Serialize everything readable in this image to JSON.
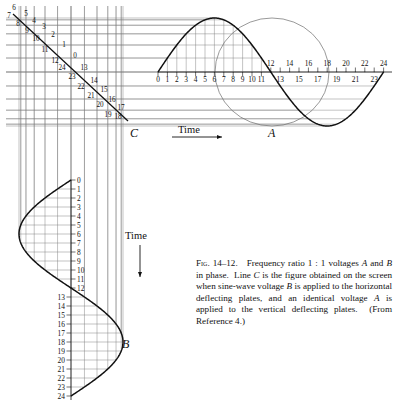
{
  "figure": {
    "caption_number": "Fig. 14–12.",
    "caption_text": "Frequency ratio 1 : 1 voltages A and B in phase. Line C is the figure obtained on the screen when sine-wave voltage B is applied to the horizontal deflecting plates, and an identical voltage A is applied to the vertical deflecting plates. (From Reference 4.)",
    "caption_parts": [
      "Frequency ratio 1 : 1 voltages",
      "A",
      " and ",
      "B",
      " in phase.  Line ",
      "C",
      " is the figure obtained on the screen when sine-wave voltage ",
      "B",
      " is applied to the horizontal deflecting plates, and an identical voltage ",
      "A",
      " is applied to the vertical deflecting plates.  (From Reference 4.)"
    ]
  },
  "labels": {
    "wave_a": "A",
    "wave_b": "B",
    "line_c": "C",
    "time_horizontal": "Time",
    "time_vertical": "Time"
  },
  "chart_data": {
    "type": "line",
    "title": "Frequency ratio 1 : 1 voltages A and B in phase",
    "xlabel": "Time",
    "ylabel": "Time",
    "grid": false,
    "legend": "none",
    "series": [
      {
        "name": "A",
        "orientation": "horizontal",
        "description": "sine-wave voltage applied to vertical deflecting plates, plotted against horizontal time axis",
        "x": [
          0,
          1,
          2,
          3,
          4,
          5,
          6,
          7,
          8,
          9,
          10,
          11,
          12,
          13,
          14,
          15,
          16,
          17,
          18,
          19,
          20,
          21,
          22,
          23,
          24
        ],
        "values": [
          0.0,
          0.259,
          0.5,
          0.707,
          0.866,
          0.966,
          1.0,
          0.966,
          0.866,
          0.707,
          0.5,
          0.259,
          0.0,
          -0.259,
          -0.5,
          -0.707,
          -0.866,
          -0.966,
          -1.0,
          -0.966,
          -0.866,
          -0.707,
          -0.5,
          -0.259,
          0.0
        ],
        "xlim": [
          0,
          24
        ],
        "ylim": [
          -1,
          1
        ],
        "tick_labels_above": [
          "12",
          "14",
          "16",
          "18",
          "20",
          "22",
          "24"
        ],
        "tick_labels_below": [
          "13",
          "15",
          "17",
          "19",
          "21",
          "23"
        ],
        "tick_labels_baseline": [
          "0",
          "1",
          "2",
          "3",
          "4",
          "5",
          "6",
          "7",
          "8",
          "9",
          "10",
          "11"
        ]
      },
      {
        "name": "B",
        "orientation": "vertical",
        "description": "sine-wave voltage applied to horizontal deflecting plates, plotted against vertical (downward) time axis",
        "t": [
          0,
          1,
          2,
          3,
          4,
          5,
          6,
          7,
          8,
          9,
          10,
          11,
          12,
          13,
          14,
          15,
          16,
          17,
          18,
          19,
          20,
          21,
          22,
          23,
          24
        ],
        "values": [
          0.0,
          -0.259,
          -0.5,
          -0.707,
          -0.866,
          -0.966,
          -1.0,
          -0.966,
          -0.866,
          -0.707,
          -0.5,
          -0.259,
          0.0,
          0.259,
          0.5,
          0.707,
          0.866,
          0.966,
          1.0,
          0.966,
          0.866,
          0.707,
          0.5,
          0.259,
          0.0
        ],
        "tlim": [
          0,
          24
        ],
        "ylim": [
          -1,
          1
        ],
        "tick_labels_right": [
          "0",
          "1",
          "2",
          "3",
          "4",
          "5",
          "6",
          "7",
          "8",
          "9",
          "10",
          "11",
          "12"
        ],
        "tick_labels_left": [
          "13",
          "14",
          "15",
          "16",
          "17",
          "18",
          "19",
          "20",
          "21",
          "22",
          "23",
          "24"
        ]
      },
      {
        "name": "C",
        "orientation": "lissajous",
        "description": "resulting Lissajous figure: straight diagonal line for 1:1 ratio, in phase",
        "phase_ratio": "1 : 1",
        "phase_difference_deg": 0,
        "point_labels": [
          "6",
          "7",
          "5",
          "8",
          "4",
          "3",
          "9",
          "2",
          "10",
          "1",
          "11",
          "0",
          "12",
          "24",
          "13",
          "23",
          "14",
          "22",
          "15",
          "21",
          "16",
          "20",
          "17",
          "19",
          "18"
        ]
      }
    ],
    "annotations": [
      {
        "text": "A",
        "role": "horizontal-sine-label"
      },
      {
        "text": "B",
        "role": "vertical-sine-label"
      },
      {
        "text": "C",
        "role": "lissajous-line-label"
      },
      {
        "text": "Time",
        "role": "horizontal-axis-arrow"
      },
      {
        "text": "Time",
        "role": "vertical-axis-arrow"
      }
    ]
  },
  "line_c_points": [
    {
      "label": "6",
      "x": 14,
      "y": 10
    },
    {
      "label": "7",
      "x": 9,
      "y": 18
    },
    {
      "label": "5",
      "x": 26,
      "y": 16
    },
    {
      "label": "8",
      "x": 18,
      "y": 26
    },
    {
      "label": "4",
      "x": 34,
      "y": 23
    },
    {
      "label": "3",
      "x": 44,
      "y": 29
    },
    {
      "label": "9",
      "x": 27,
      "y": 33
    },
    {
      "label": "2",
      "x": 53,
      "y": 37
    },
    {
      "label": "10",
      "x": 36,
      "y": 41
    },
    {
      "label": "1",
      "x": 64,
      "y": 47
    },
    {
      "label": "11",
      "x": 45,
      "y": 52
    },
    {
      "label": "0",
      "x": 75,
      "y": 58
    },
    {
      "label": "12",
      "x": 55,
      "y": 63
    },
    {
      "label": "24",
      "x": 62,
      "y": 70
    },
    {
      "label": "13",
      "x": 84,
      "y": 70
    },
    {
      "label": "23",
      "x": 72,
      "y": 79
    },
    {
      "label": "14",
      "x": 94,
      "y": 83
    },
    {
      "label": "22",
      "x": 81,
      "y": 89
    },
    {
      "label": "15",
      "x": 104,
      "y": 92
    },
    {
      "label": "21",
      "x": 91,
      "y": 98
    },
    {
      "label": "16",
      "x": 112,
      "y": 102
    },
    {
      "label": "20",
      "x": 100,
      "y": 107
    },
    {
      "label": "17",
      "x": 121,
      "y": 110
    },
    {
      "label": "19",
      "x": 108,
      "y": 117
    },
    {
      "label": "18",
      "x": 118,
      "y": 119
    }
  ],
  "axis_a": {
    "origin_x": 158,
    "origin_y": 72,
    "unit_px": 9.4,
    "tick_count": 25
  },
  "axis_b": {
    "origin_x": 71,
    "origin_y": 180,
    "unit_px": 9.0,
    "tick_count": 25
  }
}
